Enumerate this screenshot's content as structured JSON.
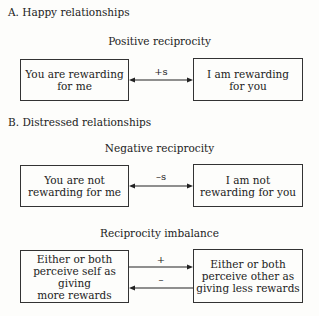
{
  "sections": [
    {
      "label": "A.  Happy relationships",
      "diagrams": [
        {
          "title": "Positive reciprocity",
          "left_box": [
            "You are rewarding",
            "for me"
          ],
          "right_box": [
            "I am rewarding",
            "for you"
          ],
          "arrows": [
            {
              "label": "+s",
              "direction": "both"
            }
          ]
        }
      ]
    },
    {
      "label": "B.  Distressed relationships",
      "diagrams": [
        {
          "title": "Negative reciprocity",
          "left_box": [
            "You are not",
            "rewarding for me"
          ],
          "right_box": [
            "I am not",
            "rewarding for you"
          ],
          "arrows": [
            {
              "label": "–s",
              "direction": "both"
            }
          ]
        },
        {
          "title": "Reciprocity imbalance",
          "left_box": [
            "Either or both",
            "perceive self as giving",
            "more rewards"
          ],
          "right_box": [
            "Either or both",
            "perceive other as",
            "giving less rewards"
          ],
          "arrows": [
            {
              "label": "+",
              "direction": "right"
            },
            {
              "label": "–",
              "direction": "left"
            }
          ]
        }
      ]
    }
  ]
}
